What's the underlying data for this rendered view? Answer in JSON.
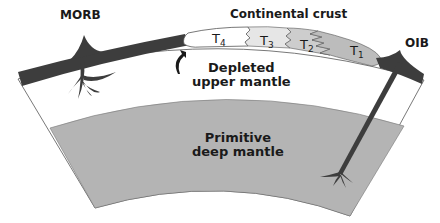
{
  "diagram": {
    "labels": {
      "morb": "MORB",
      "oib": "OIB",
      "continental_crust": "Continental crust",
      "depleted_upper_mantle_line1": "Depleted",
      "depleted_upper_mantle_line2": "upper mantle",
      "primitive_deep_mantle_line1": "Primitive",
      "primitive_deep_mantle_line2": "deep mantle"
    },
    "crust_terranes": [
      {
        "letter": "T",
        "sub": "4"
      },
      {
        "letter": "T",
        "sub": "3"
      },
      {
        "letter": "T",
        "sub": "2"
      },
      {
        "letter": "T",
        "sub": "1"
      }
    ],
    "colors": {
      "oceanic_lithosphere": "#3d3d3d",
      "upper_mantle": "#ffffff",
      "deep_mantle": "#b4b4b4",
      "crust_t4": "#ffffff",
      "crust_t3": "#e6e6e6",
      "crust_t2": "#cdcdcd",
      "crust_t1": "#bcbcbc",
      "plume": "#3d3d3d"
    }
  }
}
